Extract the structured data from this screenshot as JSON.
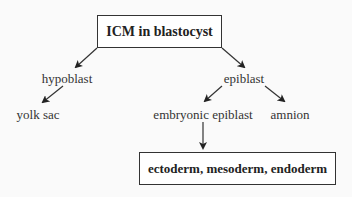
{
  "diagram": {
    "type": "flowchart",
    "root": {
      "label": "ICM in blastocyst"
    },
    "nodes": {
      "hypoblast": "hypoblast",
      "epiblast": "epiblast",
      "yolk_sac": "yolk sac",
      "embryonic_epiblast": "embryonic epiblast",
      "amnion": "amnion"
    },
    "result": {
      "label": "ectoderm, mesoderm, endoderm"
    },
    "edges": [
      [
        "ICM in blastocyst",
        "hypoblast"
      ],
      [
        "ICM in blastocyst",
        "epiblast"
      ],
      [
        "hypoblast",
        "yolk sac"
      ],
      [
        "epiblast",
        "embryonic epiblast"
      ],
      [
        "epiblast",
        "amnion"
      ],
      [
        "embryonic epiblast",
        "ectoderm, mesoderm, endoderm"
      ]
    ],
    "colors": {
      "stroke": "#333333",
      "background": "#fafafa"
    }
  }
}
